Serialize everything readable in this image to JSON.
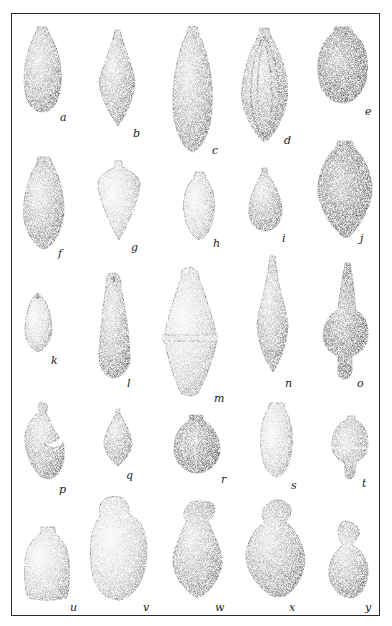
{
  "plate": {
    "description": "Engraved plate of 25 plumb-bob / weight-shaped objects",
    "labels": [
      "a",
      "b",
      "c",
      "d",
      "e",
      "f",
      "g",
      "h",
      "i",
      "j",
      "k",
      "l",
      "m",
      "n",
      "o",
      "p",
      "q",
      "r",
      "s",
      "t",
      "u",
      "v",
      "w",
      "x",
      "y"
    ]
  },
  "items": [
    {
      "label": "a",
      "x": 52,
      "y": 134
    },
    {
      "label": "b",
      "x": 133,
      "y": 142
    },
    {
      "label": "c",
      "x": 212,
      "y": 150
    },
    {
      "label": "d",
      "x": 286,
      "y": 144
    },
    {
      "label": "e",
      "x": 366,
      "y": 113
    },
    {
      "label": "f",
      "x": 60,
      "y": 255
    },
    {
      "label": "g",
      "x": 131,
      "y": 248
    },
    {
      "label": "h",
      "x": 213,
      "y": 244
    },
    {
      "label": "i",
      "x": 282,
      "y": 236
    },
    {
      "label": "j",
      "x": 361,
      "y": 238
    },
    {
      "label": "k",
      "x": 51,
      "y": 357
    },
    {
      "label": "l",
      "x": 127,
      "y": 380
    },
    {
      "label": "m",
      "x": 214,
      "y": 398
    },
    {
      "label": "n",
      "x": 286,
      "y": 382
    },
    {
      "label": "o",
      "x": 356,
      "y": 382
    },
    {
      "label": "p",
      "x": 59,
      "y": 484
    },
    {
      "label": "q",
      "x": 127,
      "y": 470
    },
    {
      "label": "r",
      "x": 222,
      "y": 472
    },
    {
      "label": "s",
      "x": 289,
      "y": 480
    },
    {
      "label": "t",
      "x": 361,
      "y": 480
    },
    {
      "label": "u",
      "x": 70,
      "y": 604
    },
    {
      "label": "v",
      "x": 143,
      "y": 604
    },
    {
      "label": "w",
      "x": 216,
      "y": 604
    },
    {
      "label": "x",
      "x": 288,
      "y": 604
    },
    {
      "label": "y",
      "x": 364,
      "y": 604
    }
  ]
}
